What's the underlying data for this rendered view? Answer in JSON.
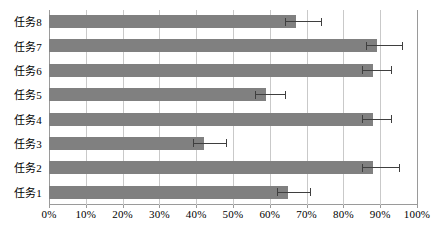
{
  "chart_data": {
    "type": "bar",
    "orientation": "horizontal",
    "title": "",
    "subtitle": "",
    "xlabel": "",
    "ylabel": "",
    "categories": [
      "任务1",
      "任务2",
      "任务3",
      "任务4",
      "任务5",
      "任务6",
      "任务7",
      "任务8"
    ],
    "category_order_top_to_bottom": [
      "任务8",
      "任务7",
      "任务6",
      "任务5",
      "任务4",
      "任务3",
      "任务2",
      "任务1"
    ],
    "values": [
      65,
      88,
      42,
      88,
      59,
      88,
      89,
      67
    ],
    "error_high": [
      71,
      95,
      48,
      93,
      64,
      93,
      96,
      74
    ],
    "series": [
      {
        "name": "",
        "color": "#808080",
        "values": [
          65,
          88,
          42,
          88,
          59,
          88,
          89,
          67
        ]
      }
    ],
    "xlim": [
      0,
      100
    ],
    "xticks": [
      0,
      10,
      20,
      30,
      40,
      50,
      60,
      70,
      80,
      90,
      100
    ],
    "xtick_labels": [
      "0%",
      "10%",
      "20%",
      "30%",
      "40%",
      "50%",
      "60%",
      "70%",
      "80%",
      "90%",
      "100%"
    ],
    "grid": {
      "vertical": true,
      "horizontal": false
    },
    "legend": {
      "visible": false,
      "entries": []
    },
    "error_bars": {
      "visible": true,
      "direction": "positive",
      "color": "#3f3f3f"
    },
    "bars": [
      {
        "category": "任务8",
        "value": 67,
        "error_high": 74,
        "color": "#808080"
      },
      {
        "category": "任务7",
        "value": 89,
        "error_high": 96,
        "color": "#808080"
      },
      {
        "category": "任务6",
        "value": 88,
        "error_high": 93,
        "color": "#808080"
      },
      {
        "category": "任务5",
        "value": 59,
        "error_high": 64,
        "color": "#808080"
      },
      {
        "category": "任务4",
        "value": 88,
        "error_high": 93,
        "color": "#808080"
      },
      {
        "category": "任务3",
        "value": 42,
        "error_high": 48,
        "color": "#808080"
      },
      {
        "category": "任务2",
        "value": 88,
        "error_high": 95,
        "color": "#808080"
      },
      {
        "category": "任务1",
        "value": 65,
        "error_high": 71,
        "color": "#808080"
      }
    ],
    "colors": {
      "bar": "#808080",
      "error": "#3f3f3f",
      "gridline": "#c9c9c9",
      "axis": "#9a9a9a",
      "background": "#ffffff",
      "text": "#000000"
    }
  }
}
